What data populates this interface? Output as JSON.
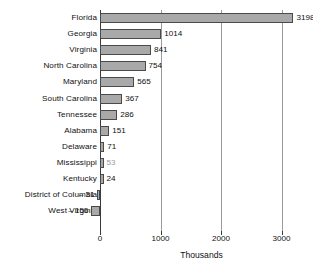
{
  "chart_data": {
    "type": "bar",
    "orientation": "horizontal",
    "title": "",
    "xlabel": "Thousands",
    "ylabel": "",
    "xlim": [
      -156,
      3198
    ],
    "xticks": [
      "0",
      "1000",
      "2000",
      "3000"
    ],
    "xtick_values": [
      0,
      1000,
      2000,
      3000
    ],
    "grid": true,
    "legend": false,
    "bar_color": "#a9a9a9",
    "bar_edge_color": "#4a4a4a",
    "categories": [
      "Florida",
      "Georgia",
      "Virginia",
      "North Carolina",
      "Maryland",
      "South Carolina",
      "Tennessee",
      "Alabama",
      "Delaware",
      "Mississippi",
      "Kentucky",
      "District of Columbia",
      "West Virginia"
    ],
    "values": [
      3198,
      1014,
      841,
      754,
      565,
      367,
      286,
      151,
      71,
      53,
      24,
      -31,
      -156
    ],
    "data_labels": [
      "3198",
      "1014",
      "841",
      "754",
      "565",
      "367",
      "286",
      "151",
      "71",
      "53",
      "24",
      "– 31",
      "– 156"
    ]
  }
}
